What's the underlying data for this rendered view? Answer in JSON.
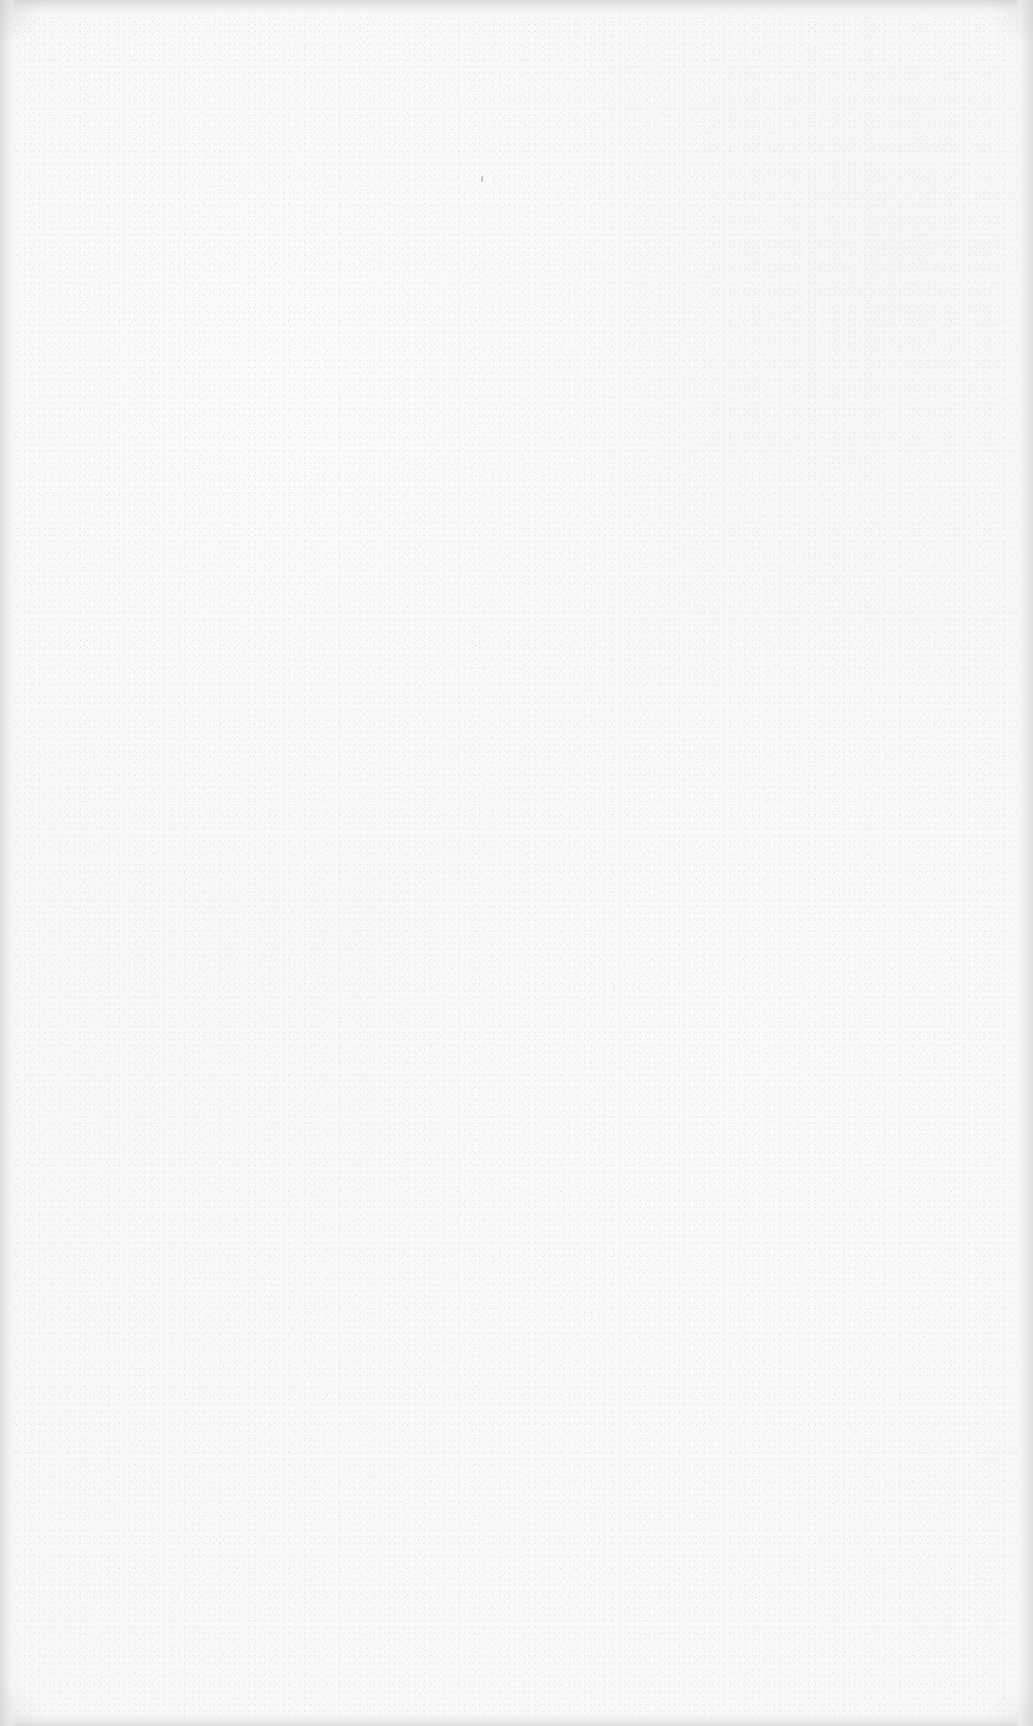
{
  "page": {
    "kind": "scanned-document-page",
    "state": "blank",
    "width": 1033,
    "height": 1726,
    "text_content": "",
    "heading": "",
    "body_text": "",
    "page_number": "",
    "header_text": "",
    "footer_text": "",
    "marginalia": ""
  },
  "appearance": {
    "paper_color": "#f8f8f8",
    "paper_color_alt": "#f7f7f7",
    "grain_color_light": "#e2e2e2",
    "grain_color_mid": "#d9d9d9",
    "grain_color_dark": "#c8c8c8",
    "edge_shadow_color": "#d8d8d8",
    "dust_mote_color": "#9a9a9a"
  },
  "artifacts": {
    "dust_mote": {
      "label": "dust-speck",
      "x": 481,
      "y": 176,
      "width": 2,
      "height": 6
    },
    "edges": {
      "top_band_height": 14,
      "bottom_band_height": 12,
      "left_band_width": 16,
      "right_band_width": 18
    }
  }
}
